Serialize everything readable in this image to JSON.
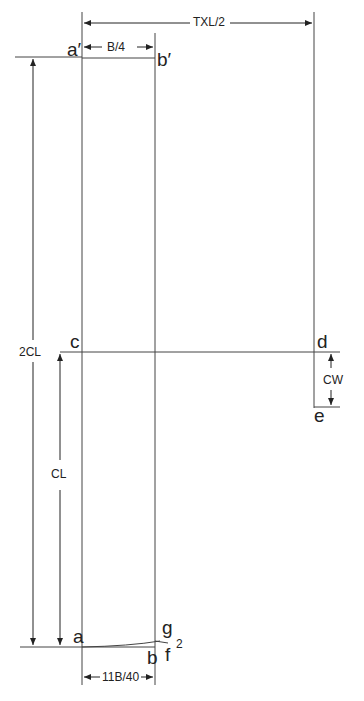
{
  "diagram": {
    "type": "pattern-draft",
    "points": {
      "a_prime": "a′",
      "b_prime": "b′",
      "c": "c",
      "d": "d",
      "e": "e",
      "a": "a",
      "b": "b",
      "g": "g",
      "f": "f",
      "sub2": "2"
    },
    "dimensions": {
      "txl_half": "TXL/2",
      "b_quarter": "B/4",
      "two_cl": "2CL",
      "cl": "CL",
      "cw": "CW",
      "eleven_b_40": "11B/40"
    },
    "line_color": "#333333"
  }
}
